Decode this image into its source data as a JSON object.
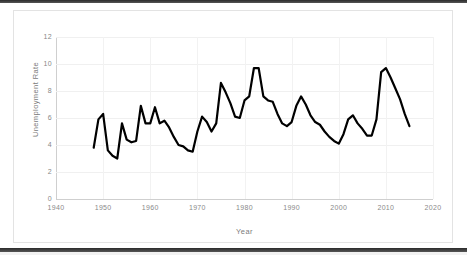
{
  "chart_data": {
    "type": "line",
    "title": "",
    "xlabel": "Year",
    "ylabel": "Unemployment Rate",
    "xlim": [
      1940,
      2020
    ],
    "ylim": [
      0,
      12
    ],
    "xticks": [
      1940,
      1950,
      1960,
      1970,
      1980,
      1990,
      2000,
      2010,
      2020
    ],
    "yticks": [
      0,
      2,
      4,
      6,
      8,
      10,
      12
    ],
    "grid": true,
    "legend": "none",
    "line_color": "#000000",
    "line_width": 2.2,
    "series": [
      {
        "name": "Unemployment Rate",
        "x": [
          1948,
          1949,
          1950,
          1951,
          1952,
          1953,
          1954,
          1955,
          1956,
          1957,
          1958,
          1959,
          1960,
          1961,
          1962,
          1963,
          1964,
          1965,
          1966,
          1967,
          1968,
          1969,
          1970,
          1971,
          1972,
          1973,
          1974,
          1975,
          1976,
          1977,
          1978,
          1979,
          1980,
          1981,
          1982,
          1983,
          1984,
          1985,
          1986,
          1987,
          1988,
          1989,
          1990,
          1991,
          1992,
          1993,
          1994,
          1995,
          1996,
          1997,
          1998,
          1999,
          2000,
          2001,
          2002,
          2003,
          2004,
          2005,
          2006,
          2007,
          2008,
          2009,
          2010,
          2011,
          2012,
          2013,
          2014,
          2015
        ],
        "values": [
          3.8,
          5.9,
          6.3,
          3.6,
          3.2,
          3.0,
          5.6,
          4.4,
          4.2,
          4.3,
          6.9,
          5.6,
          5.6,
          6.8,
          5.6,
          5.8,
          5.3,
          4.6,
          4.0,
          3.9,
          3.6,
          3.5,
          5.0,
          6.1,
          5.7,
          5.0,
          5.6,
          8.6,
          7.9,
          7.1,
          6.1,
          6.0,
          7.3,
          7.6,
          9.7,
          9.7,
          7.6,
          7.3,
          7.2,
          6.3,
          5.6,
          5.4,
          5.7,
          6.9,
          7.6,
          7.0,
          6.2,
          5.7,
          5.5,
          5.0,
          4.6,
          4.3,
          4.1,
          4.8,
          5.9,
          6.2,
          5.6,
          5.2,
          4.7,
          4.7,
          5.9,
          9.4,
          9.7,
          9.0,
          8.2,
          7.4,
          6.3,
          5.4
        ]
      }
    ]
  },
  "axis": {
    "y_title": "Unemployment Rate",
    "x_title": "Year",
    "y_tick_labels": [
      "12",
      "10",
      "8",
      "6",
      "4",
      "2",
      "0"
    ],
    "x_tick_labels": [
      "1940",
      "1950",
      "1960",
      "1970",
      "1980",
      "1990",
      "2000",
      "2010",
      "2020"
    ]
  },
  "colors": {
    "line": "#000000",
    "grid": "#f0f0f0",
    "axis": "#cfcfcf",
    "tick_text": "#8a8a8a",
    "title_text": "#7b7b7b",
    "frame_border": "#e3e3e3",
    "background": "#ffffff"
  }
}
